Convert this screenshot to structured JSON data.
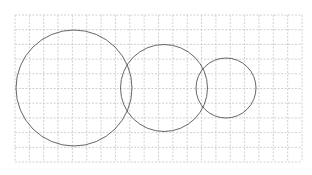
{
  "diagram": {
    "type": "venn-like-circles-on-grid",
    "background": "#ffffff",
    "grid": {
      "x0": 15,
      "y0": 15,
      "x1": 302,
      "y1": 162,
      "columns": 20,
      "rows": 10,
      "color": "#c4c4c4",
      "dash": "2,1.5"
    },
    "circles": [
      {
        "name": "large-circle",
        "cx": 74,
        "cy": 88,
        "r": 58,
        "stroke": "#555555"
      },
      {
        "name": "medium-circle",
        "cx": 164,
        "cy": 88,
        "r": 43.5,
        "stroke": "#555555"
      },
      {
        "name": "small-circle",
        "cx": 226,
        "cy": 88,
        "r": 30,
        "stroke": "#555555"
      }
    ]
  }
}
